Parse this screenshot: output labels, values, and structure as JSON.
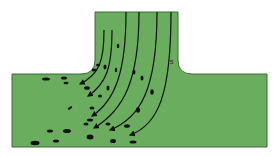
{
  "diagram": {
    "type": "T-junction flow with streamlines and particles",
    "colors": {
      "background": "#ffffff",
      "fluid": "#6aad5e",
      "wall": "#3f6b3a",
      "streamline": "#111111",
      "particle": "#111111"
    },
    "geometry": {
      "main_channel": {
        "x1": 12,
        "x2": 267,
        "y_top": 74,
        "y_bottom": 147
      },
      "branch": {
        "x1": 95,
        "x2": 178,
        "y_top": 12
      },
      "fillet_radius": 14
    },
    "labels": [
      {
        "text": "5",
        "x": 171,
        "y": 63
      }
    ],
    "streamline_count": 6,
    "flow_direction": "from branch top, turning left into main channel"
  }
}
